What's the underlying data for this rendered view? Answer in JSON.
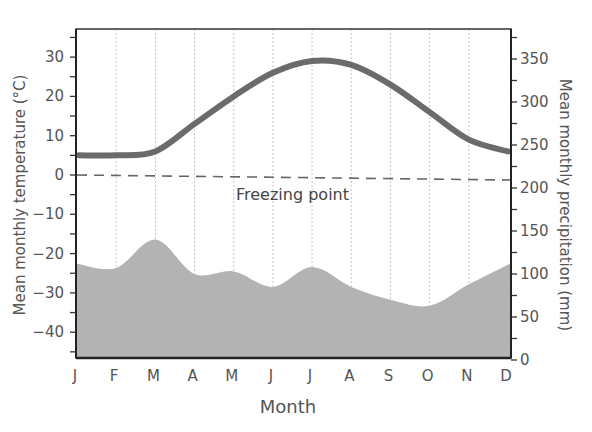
{
  "chart_data": {
    "type": "line+area",
    "title": "",
    "xlabel": "Month",
    "ylabel_left": "Mean monthly temperature (°C)",
    "ylabel_right": "Mean monthly precipitation (mm)",
    "categories": [
      "J",
      "F",
      "M",
      "A",
      "M",
      "J",
      "J",
      "A",
      "S",
      "O",
      "N",
      "D"
    ],
    "ylim_left": [
      -46,
      37
    ],
    "ylim_right": [
      0,
      375
    ],
    "yticks_left": [
      30,
      20,
      10,
      0,
      -10,
      -20,
      -30,
      -40
    ],
    "yticks_right": [
      350,
      300,
      250,
      200,
      150,
      100,
      50,
      0
    ],
    "grid": "vertical dotted lines at each month",
    "series": [
      {
        "name": "Mean monthly temperature",
        "type": "line",
        "axis": "left",
        "color": "#6b6b6b",
        "values": [
          5,
          5,
          6,
          13,
          20,
          26,
          29,
          28,
          23,
          16,
          9,
          6
        ]
      },
      {
        "name": "Mean monthly precipitation",
        "type": "area",
        "axis": "right",
        "color": "#b3b3b3",
        "values": [
          112,
          107,
          140,
          100,
          103,
          85,
          108,
          85,
          70,
          63,
          88,
          112
        ]
      }
    ],
    "annotations": [
      {
        "text": "Freezing point",
        "type": "dashed reference line",
        "y_left": 0
      }
    ]
  }
}
